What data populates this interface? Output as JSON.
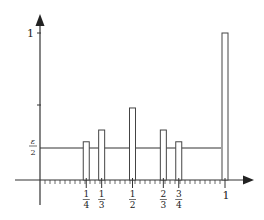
{
  "chart_data": {
    "type": "bar",
    "title": "",
    "xlabel": "",
    "ylabel": "",
    "xlim": [
      0,
      1
    ],
    "ylim": [
      0,
      1
    ],
    "grid": false,
    "legend": null,
    "categories": [
      "1/4",
      "1/3",
      "1/2",
      "2/3",
      "3/4",
      "1"
    ],
    "x": [
      0.25,
      0.3333,
      0.5,
      0.6667,
      0.75,
      1.0
    ],
    "values": [
      0.26,
      0.34,
      0.49,
      0.34,
      0.26,
      1.0
    ],
    "reference_line": {
      "label": "ε/2",
      "y": 0.23
    },
    "y_ticks": [
      {
        "value": 0.5,
        "label": ""
      },
      {
        "value": 1,
        "label": "1"
      }
    ],
    "x_tick_labels": [
      {
        "value": 0.25,
        "num": "1",
        "den": "4"
      },
      {
        "value": 0.3333,
        "num": "1",
        "den": "3"
      },
      {
        "value": 0.5,
        "num": "1",
        "den": "2"
      },
      {
        "value": 0.6667,
        "num": "2",
        "den": "3"
      },
      {
        "value": 0.75,
        "num": "3",
        "den": "4"
      },
      {
        "value": 1,
        "label": "1"
      }
    ],
    "minor_x_ticks_count": 36
  },
  "labels": {
    "y_one": "1",
    "eps_num": "ε",
    "eps_den": "2",
    "x_one": "1"
  }
}
